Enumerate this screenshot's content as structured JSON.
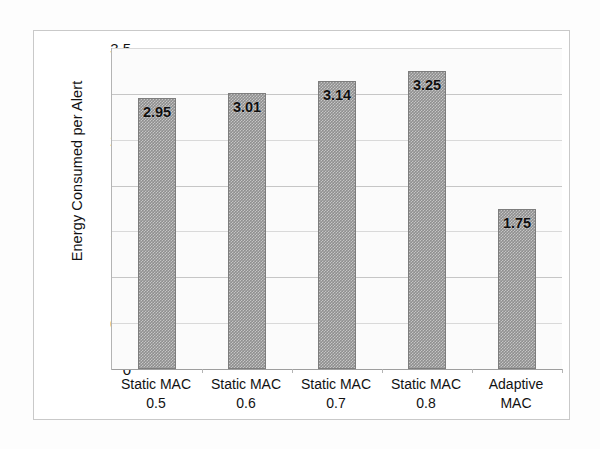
{
  "figure": {
    "background_color": "#fdfdfd",
    "frame_color": "#c9c9c9",
    "plot_background_color": "#fbfbfb",
    "bar_color": "#8f8f8f",
    "gridline_color": "#d9d9d9",
    "axis_color": "#b4b4b4"
  },
  "chart_data": {
    "type": "bar",
    "title": "",
    "xlabel": "",
    "ylabel": "Energy Consumed per Alert",
    "categories": [
      "Static MAC 0.5",
      "Static MAC 0.6",
      "Static MAC 0.7",
      "Static MAC 0.8",
      "Adaptive MAC"
    ],
    "category_lines": [
      [
        "Static MAC",
        "0.5"
      ],
      [
        "Static MAC",
        "0.6"
      ],
      [
        "Static MAC",
        "0.7"
      ],
      [
        "Static MAC",
        "0.8"
      ],
      [
        "Adaptive",
        "MAC"
      ]
    ],
    "values": [
      2.95,
      3.01,
      3.14,
      3.25,
      1.75
    ],
    "value_labels": [
      "2.95",
      "3.01",
      "3.14",
      "3.25",
      "1.75"
    ],
    "ylim": [
      0,
      3.5
    ],
    "ytick_values": [
      0,
      0.5,
      1,
      1.5,
      2,
      2.5,
      3,
      3.5
    ],
    "ytick_labels": [
      "0",
      "0.5",
      "1",
      "1.5",
      "2",
      "2.5",
      "3",
      "3.5"
    ],
    "grid": true,
    "grid_axis": "y",
    "legend": false,
    "legend_position": "none",
    "series": [
      {
        "name": "Energy Consumed per Alert",
        "values": [
          2.95,
          3.01,
          3.14,
          3.25,
          1.75
        ]
      }
    ]
  }
}
